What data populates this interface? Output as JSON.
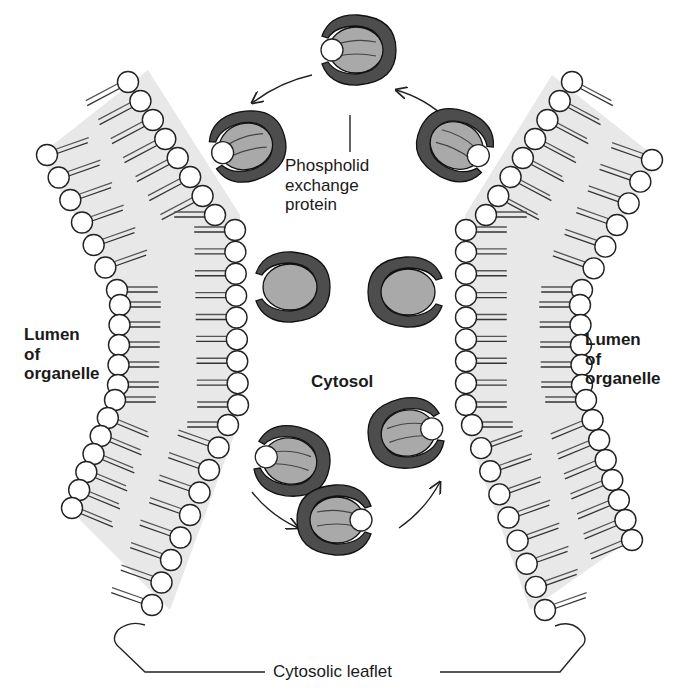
{
  "labels": {
    "lumen_left": [
      "Lumen",
      "of",
      "organelle"
    ],
    "lumen_right": [
      "Lumen",
      "of",
      "organelle"
    ],
    "cytosol": "Cytosol",
    "exchange_protein": [
      "Phospholid",
      "exchange",
      "protein"
    ],
    "cytosolic_leaflet": "Cytosolic leaflet"
  },
  "colors": {
    "protein_outer": "#4d4d4d",
    "protein_inner": "#a9a9a9",
    "membrane_band": "#e6e6e6",
    "lipid_head_fill": "#ffffff",
    "lipid_outline": "#222222",
    "text": "#1a1a1a"
  },
  "diagram": {
    "left_membrane": "X-shaped lipid bilayer bent toward cytosol",
    "right_membrane": "mirror image lipid bilayer",
    "proteins": [
      {
        "id": "top",
        "x": 350,
        "y": 50,
        "carrying_lipid": true
      },
      {
        "id": "upper-left",
        "x": 240,
        "y": 148,
        "carrying_lipid": true
      },
      {
        "id": "upper-right",
        "x": 460,
        "y": 148,
        "carrying_lipid": true
      },
      {
        "id": "mid-left",
        "x": 285,
        "y": 288,
        "carrying_lipid": false
      },
      {
        "id": "mid-right",
        "x": 413,
        "y": 292,
        "carrying_lipid": false
      },
      {
        "id": "lower-left",
        "x": 285,
        "y": 458,
        "carrying_lipid": true
      },
      {
        "id": "lower-right",
        "x": 413,
        "y": 432,
        "carrying_lipid": true
      },
      {
        "id": "bottom",
        "x": 343,
        "y": 518,
        "carrying_lipid": true
      }
    ]
  }
}
